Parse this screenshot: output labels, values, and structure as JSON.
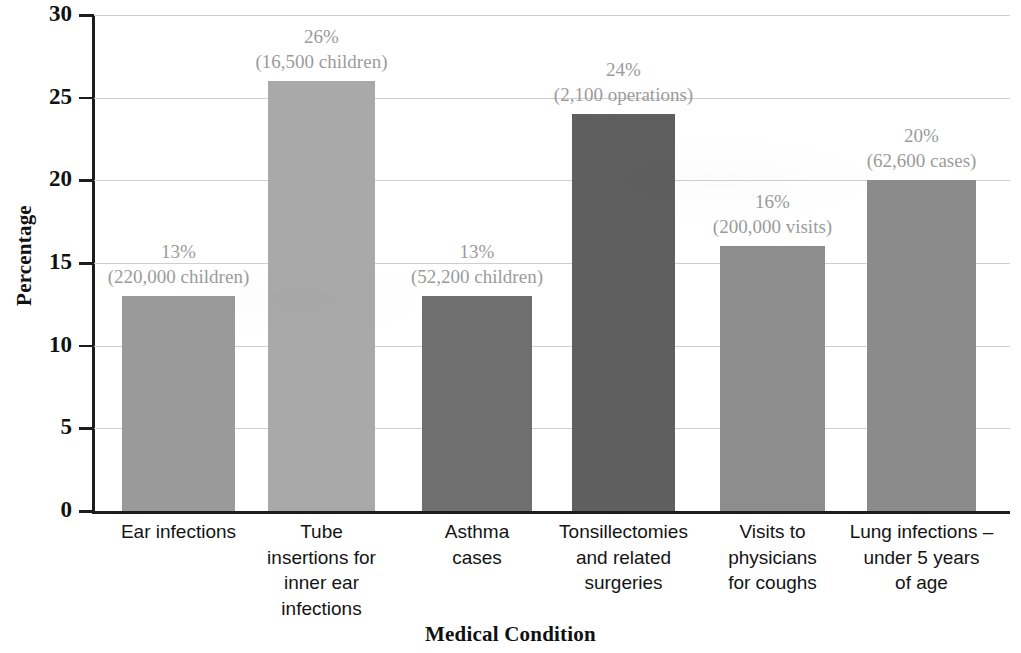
{
  "chart_data": {
    "type": "bar",
    "title": "",
    "xlabel": "Medical Condition",
    "ylabel": "Percentage",
    "ylim": [
      0,
      30
    ],
    "yticks": [
      0,
      5,
      10,
      15,
      20,
      25,
      30
    ],
    "ytick_labels": [
      "0",
      "5",
      "10",
      "15",
      "20",
      "25",
      "30"
    ],
    "grid": true,
    "legend": "none",
    "categories": [
      "Ear infections",
      "Tube insertions for inner ear infections",
      "Asthma cases",
      "Tonsillectomies and related surgeries",
      "Visits to physicians for coughs",
      "Lung infections – under 5 years of age"
    ],
    "values": [
      13,
      26,
      13,
      24,
      16,
      20
    ],
    "point_labels": [
      {
        "percent": "13%",
        "count": "(220,000 children)"
      },
      {
        "percent": "26%",
        "count": "(16,500 children)"
      },
      {
        "percent": "13%",
        "count": "(52,200 children)"
      },
      {
        "percent": "24%",
        "count": "(2,100 operations)"
      },
      {
        "percent": "16%",
        "count": "(200,000 visits)"
      },
      {
        "percent": "20%",
        "count": "(62,600 cases)"
      }
    ],
    "bar_colors": [
      "#9a9a9a",
      "#a9a9a9",
      "#6f6f6f",
      "#5f5f5f",
      "#8d8d8d",
      "#8b8b8b"
    ],
    "category_lines": [
      [
        "Ear infections"
      ],
      [
        "Tube",
        "insertions for",
        "inner ear",
        "infections"
      ],
      [
        "Asthma",
        "cases"
      ],
      [
        "Tonsillectomies",
        "and related",
        "surgeries"
      ],
      [
        "Visits to",
        "physicians",
        "for coughs"
      ],
      [
        "Lung infections –",
        "under 5 years",
        "of age"
      ]
    ]
  },
  "style": {
    "grid_color": "#cfcfcf",
    "axis_color": "#1c1c1c",
    "label_color": "#9b9b9b",
    "text_color": "#141414",
    "background": "#ffffff"
  }
}
